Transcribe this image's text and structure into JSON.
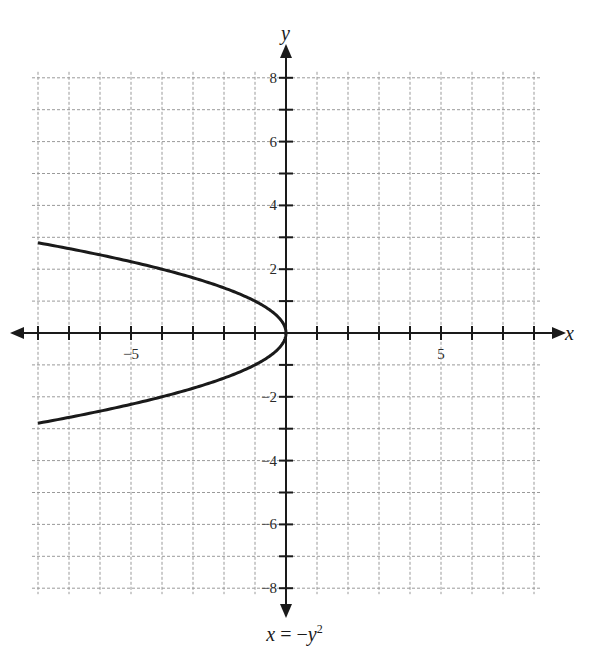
{
  "chart_data": {
    "type": "line",
    "title": "",
    "caption": "x = -y^2",
    "xlabel": "x",
    "ylabel": "y",
    "xlim": [
      -8,
      8
    ],
    "ylim": [
      -8,
      8
    ],
    "grid": true,
    "grid_style": "dashed",
    "x_tick_labels": [
      {
        "value": -5,
        "label": "−5"
      },
      {
        "value": 5,
        "label": "5"
      }
    ],
    "y_tick_labels": [
      {
        "value": 8,
        "label": "8"
      },
      {
        "value": 6,
        "label": "6"
      },
      {
        "value": 4,
        "label": "4"
      },
      {
        "value": 2,
        "label": "2"
      },
      {
        "value": -2,
        "label": "−2"
      },
      {
        "value": -4,
        "label": "−4"
      },
      {
        "value": -6,
        "label": "−6"
      },
      {
        "value": -8,
        "label": "−8"
      }
    ],
    "series": [
      {
        "name": "x = -y^2",
        "equation": "x = -y^2",
        "points": [
          [
            -8,
            2.83
          ],
          [
            -7,
            2.65
          ],
          [
            -6,
            2.45
          ],
          [
            -5,
            2.24
          ],
          [
            -4,
            2.0
          ],
          [
            -3,
            1.73
          ],
          [
            -2,
            1.41
          ],
          [
            -1,
            1.0
          ],
          [
            -0.25,
            0.5
          ],
          [
            0,
            0
          ],
          [
            -0.25,
            -0.5
          ],
          [
            -1,
            -1.0
          ],
          [
            -2,
            -1.41
          ],
          [
            -3,
            -1.73
          ],
          [
            -4,
            -2.0
          ],
          [
            -5,
            -2.24
          ],
          [
            -6,
            -2.45
          ],
          [
            -7,
            -2.65
          ],
          [
            -8,
            -2.83
          ]
        ],
        "color": "#1a1a1a"
      }
    ]
  },
  "caption": {
    "lhs": "x",
    "eq": " = −",
    "var": "y",
    "exp": "2"
  },
  "axes": {
    "x_label": "x",
    "y_label": "y"
  },
  "colors": {
    "curve": "#1a1a1a",
    "axis": "#1a1a1a",
    "grid": "#9a9a9a"
  }
}
